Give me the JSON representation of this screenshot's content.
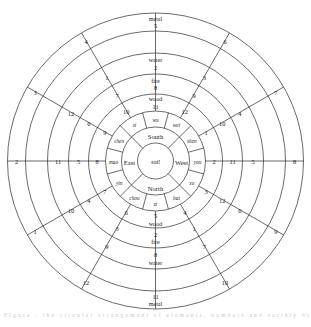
{
  "figure": {
    "caption_faint": "Figure : the circular arrangement of elements, numbers and earthly branches"
  },
  "colors": {
    "stroke": "#2b2b2b",
    "background": "#ffffff",
    "text": "#1a1a1a"
  },
  "center": {
    "label": "soil"
  },
  "directions": {
    "north": "North",
    "south": "South",
    "east": "East",
    "west": "West"
  },
  "branches": {
    "si": "si",
    "wu": "wu",
    "wei": "wei",
    "chen_left": "chen",
    "shen": "shen",
    "mao": "mao",
    "you": "you",
    "yin": "yin",
    "xu": "xu",
    "chou": "chou",
    "hai": "hai",
    "zi": "zi"
  },
  "vertical_top": [
    {
      "element": "wood",
      "number": "11"
    },
    {
      "element": "fire",
      "number": "8"
    },
    {
      "element": "water",
      "number": "2"
    },
    {
      "element": "metal",
      "number": "5"
    }
  ],
  "vertical_bottom": [
    {
      "number": "5",
      "element": "wood"
    },
    {
      "number": "2",
      "element": "fire"
    },
    {
      "number": "8",
      "element": "water"
    },
    {
      "number": "11",
      "element": "metal"
    }
  ],
  "horizontal_left": [
    "8",
    "5",
    "11",
    "2"
  ],
  "horizontal_right": [
    "2",
    "11",
    "5",
    "8"
  ],
  "quadrant_upper_left": {
    "inner_to_outer_a": [
      "10",
      "7",
      "1",
      "4"
    ],
    "inner_to_outer_b": [
      "9",
      "6",
      "12",
      "3"
    ]
  },
  "quadrant_upper_right": {
    "inner_to_outer_a": [
      "12",
      "9",
      "3",
      "6"
    ],
    "inner_to_outer_b": [
      "1",
      "10",
      "4",
      "7"
    ]
  },
  "quadrant_lower_left": {
    "inner_to_outer_a": [
      "6",
      "3",
      "9",
      "12"
    ],
    "inner_to_outer_b": [
      "7",
      "4",
      "10",
      "1"
    ]
  },
  "quadrant_lower_right": {
    "inner_to_outer_a": [
      "4",
      "1",
      "7",
      "10"
    ],
    "inner_to_outer_b": [
      "3",
      "12",
      "6",
      "9"
    ]
  },
  "chart_data": {
    "type": "pie",
    "rings": [
      {
        "index": 0,
        "name": "center",
        "radius_px": 18,
        "labels": [
          "soil"
        ]
      },
      {
        "index": 1,
        "name": "directions",
        "radius_px": 34,
        "labels": [
          "South",
          "West",
          "North",
          "East"
        ]
      },
      {
        "index": 2,
        "name": "branches",
        "radius_px": 50,
        "labels": [
          "wu",
          "wei",
          "shen",
          "you",
          "xu",
          "hai",
          "zi",
          "chou",
          "yin",
          "mao",
          "chen",
          "si"
        ]
      },
      {
        "index": 3,
        "name": "number-ring-1",
        "radius_px": 66,
        "labels": [
          "11",
          "12",
          "1",
          "2",
          "3",
          "4",
          "5",
          "6",
          "7",
          "8",
          "9",
          "10"
        ]
      },
      {
        "index": 4,
        "name": "number-ring-2",
        "radius_px": 84,
        "labels": [
          "8",
          "9",
          "10",
          "11",
          "12",
          "1",
          "2",
          "3",
          "4",
          "5",
          "6",
          "7"
        ]
      },
      {
        "index": 5,
        "name": "number-ring-3",
        "radius_px": 104,
        "labels": [
          "2",
          "3",
          "4",
          "5",
          "6",
          "7",
          "8",
          "9",
          "10",
          "11",
          "12",
          "1"
        ]
      },
      {
        "index": 6,
        "name": "number-ring-4",
        "radius_px": 126,
        "labels": [
          "5",
          "6",
          "7",
          "8",
          "9",
          "10",
          "11",
          "12",
          "1",
          "2",
          "3",
          "4"
        ]
      }
    ],
    "elements": [
      "metal",
      "water",
      "fire",
      "wood",
      "soil"
    ],
    "element_numbers": {
      "metal": 5,
      "water": 2,
      "fire": 8,
      "wood": 11,
      "soil": 0
    },
    "legend": []
  }
}
